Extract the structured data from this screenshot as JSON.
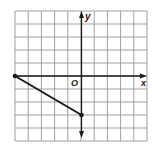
{
  "figure": {
    "type": "coordinate-plane-segment",
    "grid": {
      "columns": 10,
      "rows": 10,
      "x_range": [
        -5,
        5
      ],
      "y_range": [
        -5,
        5
      ]
    },
    "axes": {
      "x_label": "x",
      "y_label": "y",
      "origin_label": "O"
    },
    "segment": {
      "start": {
        "x": -5,
        "y": 0
      },
      "end": {
        "x": 0,
        "y": -3
      }
    },
    "colors": {
      "grid": "#8a8a8a",
      "axis": "#1a1a1a",
      "segment": "#1a1a1a",
      "background": "#ffffff"
    }
  }
}
